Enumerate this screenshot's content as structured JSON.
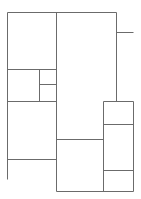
{
  "diagram": {
    "type": "floor-plan-lines",
    "stroke_color": "#6b6b6b",
    "background": "#ffffff",
    "segments": [
      {
        "name": "top-wall",
        "x1": 7,
        "y1": 12,
        "x2": 116,
        "y2": 12
      },
      {
        "name": "left-wall",
        "x1": 7,
        "y1": 12,
        "x2": 7,
        "y2": 179
      },
      {
        "name": "center-wall",
        "x1": 56,
        "y1": 12,
        "x2": 56,
        "y2": 191
      },
      {
        "name": "right-upper-wall",
        "x1": 116,
        "y1": 12,
        "x2": 116,
        "y2": 101
      },
      {
        "name": "right-stub",
        "x1": 116,
        "y1": 32,
        "x2": 133,
        "y2": 32
      },
      {
        "name": "left-room-divider-1",
        "x1": 7,
        "y1": 69,
        "x2": 56,
        "y2": 69
      },
      {
        "name": "small-room-vertical",
        "x1": 39,
        "y1": 69,
        "x2": 39,
        "y2": 101
      },
      {
        "name": "small-room-divider",
        "x1": 39,
        "y1": 84,
        "x2": 56,
        "y2": 84
      },
      {
        "name": "left-room-divider-2",
        "x1": 7,
        "y1": 101,
        "x2": 56,
        "y2": 101
      },
      {
        "name": "left-room-divider-3",
        "x1": 7,
        "y1": 159,
        "x2": 56,
        "y2": 159
      },
      {
        "name": "center-divider",
        "x1": 56,
        "y1": 139,
        "x2": 103,
        "y2": 139
      },
      {
        "name": "right-box-top",
        "x1": 103,
        "y1": 101,
        "x2": 133,
        "y2": 101
      },
      {
        "name": "right-box-left",
        "x1": 103,
        "y1": 101,
        "x2": 103,
        "y2": 191
      },
      {
        "name": "right-box-right",
        "x1": 133,
        "y1": 101,
        "x2": 133,
        "y2": 191
      },
      {
        "name": "right-box-divider-1",
        "x1": 103,
        "y1": 124,
        "x2": 133,
        "y2": 124
      },
      {
        "name": "right-box-divider-2",
        "x1": 103,
        "y1": 170,
        "x2": 133,
        "y2": 170
      },
      {
        "name": "bottom-wall",
        "x1": 56,
        "y1": 191,
        "x2": 133,
        "y2": 191
      }
    ]
  }
}
